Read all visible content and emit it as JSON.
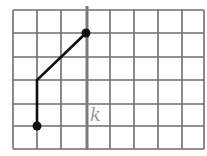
{
  "diagram": {
    "grid": {
      "columns": 8,
      "rows": 6,
      "line_color": "#6e6e6e"
    },
    "axis_line": {
      "label": "k",
      "column_index": 3,
      "color": "#8a8a8a"
    },
    "path": {
      "points": [
        [
          3,
          1
        ],
        [
          1,
          3
        ],
        [
          1,
          5
        ]
      ],
      "endpoints_marked": true,
      "color": "#111111"
    }
  }
}
